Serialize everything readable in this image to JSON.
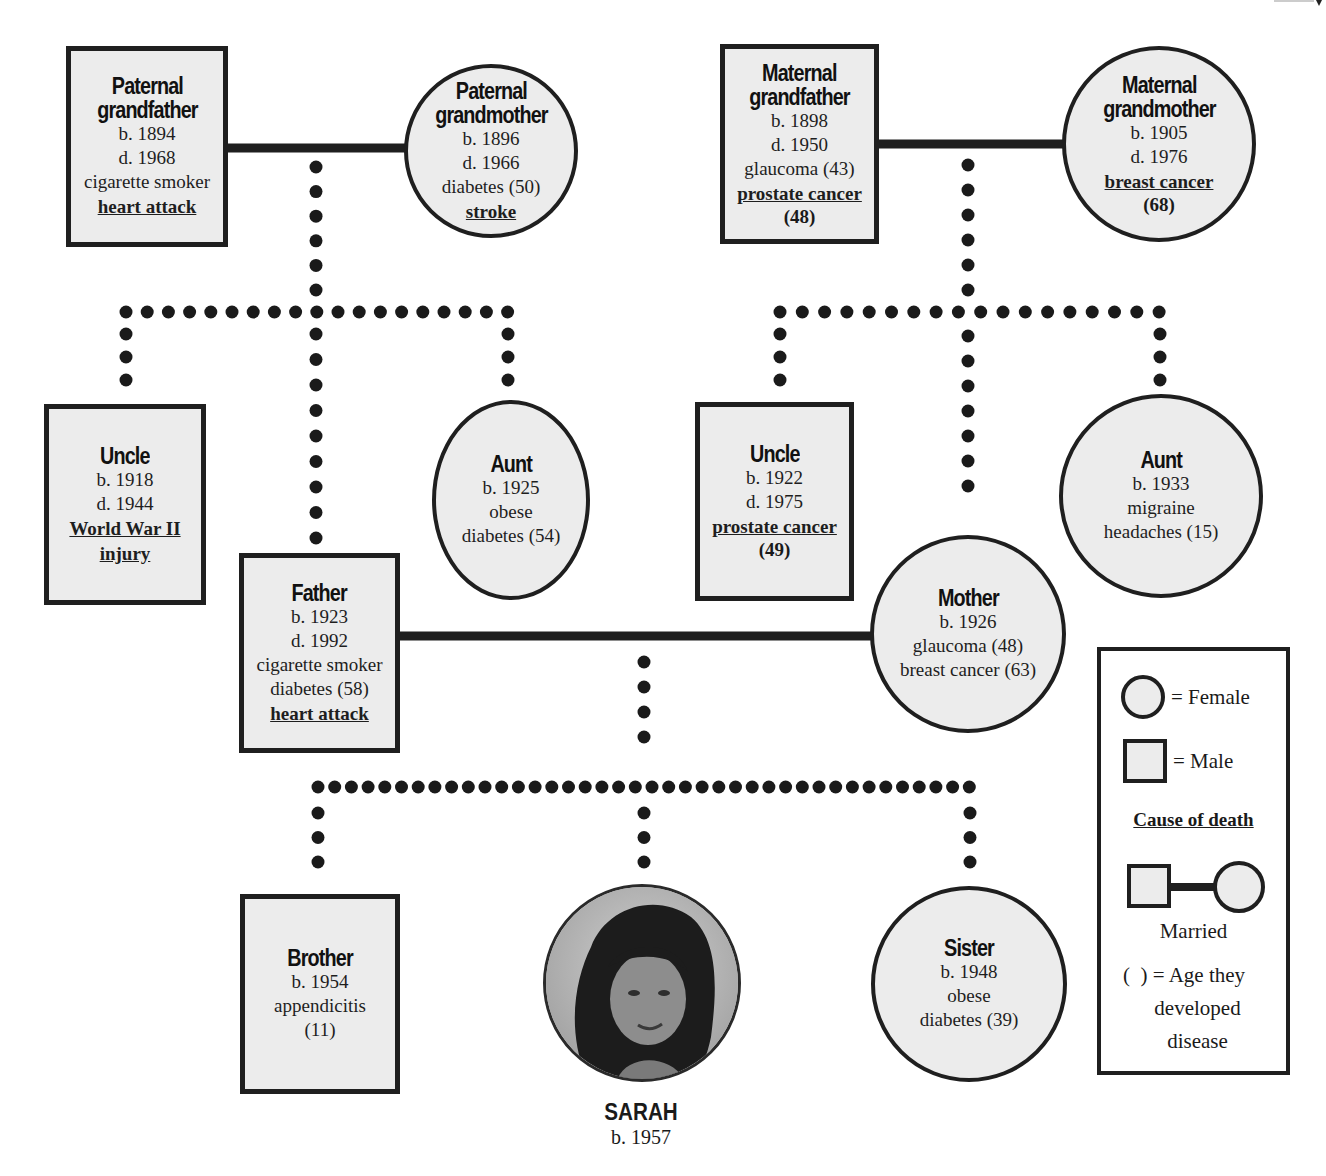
{
  "diagram": {
    "type": "family pedigree chart",
    "people": {
      "paternal_grandfather": {
        "title1": "Paternal",
        "title2": "grandfather",
        "born": "b. 1894",
        "died": "d. 1968",
        "notes": [
          "cigarette smoker"
        ],
        "cause_of_death": "heart attack",
        "sex": "male"
      },
      "paternal_grandmother": {
        "title1": "Paternal",
        "title2": "grandmother",
        "born": "b. 1896",
        "died": "d. 1966",
        "notes": [
          "diabetes (50)"
        ],
        "cause_of_death": "stroke",
        "sex": "female"
      },
      "maternal_grandfather": {
        "title1": "Maternal",
        "title2": "grandfather",
        "born": "b. 1898",
        "died": "d. 1950",
        "notes": [
          "glaucoma (43)"
        ],
        "cause_of_death": "prostate cancer",
        "cause_age": "(48)",
        "sex": "male"
      },
      "maternal_grandmother": {
        "title1": "Maternal",
        "title2": "grandmother",
        "born": "b. 1905",
        "died": "d. 1976",
        "cause_of_death": "breast cancer",
        "cause_age": "(68)",
        "sex": "female"
      },
      "paternal_uncle": {
        "title": "Uncle",
        "born": "b. 1918",
        "died": "d. 1944",
        "cause_of_death_1": "World War II",
        "cause_of_death_2": "injury",
        "sex": "male"
      },
      "paternal_aunt": {
        "title": "Aunt",
        "born": "b. 1925",
        "notes": [
          "obese",
          "diabetes (54)"
        ],
        "sex": "female"
      },
      "father": {
        "title": "Father",
        "born": "b. 1923",
        "died": "d. 1992",
        "notes": [
          "cigarette smoker",
          "diabetes (58)"
        ],
        "cause_of_death": "heart attack",
        "sex": "male"
      },
      "maternal_uncle": {
        "title": "Uncle",
        "born": "b. 1922",
        "died": "d. 1975",
        "cause_of_death": "prostate cancer",
        "cause_age": "(49)",
        "sex": "male"
      },
      "maternal_aunt": {
        "title": "Aunt",
        "born": "b. 1933",
        "notes": [
          "migraine",
          "headaches (15)"
        ],
        "sex": "female"
      },
      "mother": {
        "title": "Mother",
        "born": "b. 1926",
        "notes": [
          "glaucoma (48)",
          "breast cancer (63)"
        ],
        "sex": "female"
      },
      "brother": {
        "title": "Brother",
        "born": "b. 1954",
        "notes": [
          "appendicitis",
          "(11)"
        ],
        "sex": "male"
      },
      "sarah": {
        "title": "SARAH",
        "born": "b. 1957",
        "sex": "female",
        "photo": "portrait-photo"
      },
      "sister": {
        "title": "Sister",
        "born": "b. 1948",
        "notes": [
          "obese",
          "diabetes (39)"
        ],
        "sex": "female"
      }
    },
    "legend": {
      "female": "= Female",
      "male": "= Male",
      "cause_of_death": "Cause of death",
      "married": "Married",
      "age_1": "(  ) = Age they",
      "age_2": "developed",
      "age_3": "disease"
    },
    "colors": {
      "fill": "#ececec",
      "stroke": "#1f1f1f",
      "background": "#ffffff"
    }
  }
}
